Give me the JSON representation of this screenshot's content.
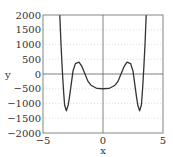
{
  "chart_data": {
    "type": "line",
    "title": "",
    "xlabel": "x",
    "ylabel": "y",
    "xlim": [
      -5,
      5
    ],
    "ylim": [
      -2000,
      2000
    ],
    "xticks": [
      -5,
      0,
      5
    ],
    "yticks": [
      2000,
      1500,
      1000,
      500,
      0,
      -500,
      -1000,
      -1500,
      -2000
    ],
    "xtick_labels": [
      "-5",
      "0",
      "5"
    ],
    "ytick_labels": [
      "2000",
      "1500",
      "1000",
      "500",
      "0",
      "-500",
      "-1000",
      "-1500",
      "-2000"
    ],
    "grid": "horizontal dotted",
    "legend": null,
    "series": [
      {
        "name": "y(x)",
        "color": "#333333",
        "x": [
          -3.6,
          -3.5,
          -3.4,
          -3.3,
          -3.2,
          -3.05,
          -2.9,
          -2.8,
          -2.65,
          -2.5,
          -2.3,
          -2.0,
          -1.75,
          -1.5,
          -1.25,
          -1.0,
          -0.5,
          0,
          0.5,
          1.0,
          1.25,
          1.5,
          1.75,
          2.0,
          2.3,
          2.5,
          2.65,
          2.8,
          2.9,
          3.05,
          3.2,
          3.3,
          3.4,
          3.5,
          3.6
        ],
        "y": [
          2000,
          1000,
          200,
          -500,
          -1050,
          -1250,
          -1050,
          -800,
          -350,
          100,
          350,
          400,
          250,
          0,
          -250,
          -380,
          -490,
          -500,
          -490,
          -380,
          -250,
          0,
          250,
          400,
          350,
          100,
          -350,
          -800,
          -1050,
          -1250,
          -1050,
          -500,
          200,
          1000,
          2000
        ]
      }
    ],
    "reference_lines": {
      "x": 0,
      "y": 0
    }
  }
}
